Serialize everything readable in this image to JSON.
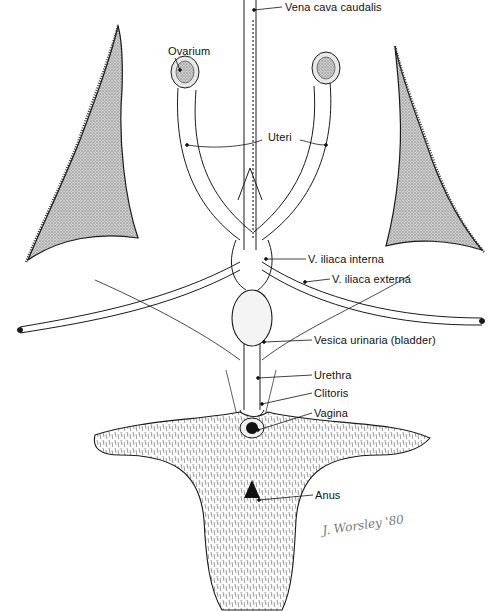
{
  "figure": {
    "type": "anatomical illustration",
    "labels": {
      "vena_cava": "Vena cava caudalis",
      "ovarium": "Ovarium",
      "uteri": "Uteri",
      "iliaca_interna": "V. iliaca interna",
      "iliaca_externa": "V. iliaca externa",
      "vesica": "Vesica urinaria (bladder)",
      "urethra": "Urethra",
      "clitoris": "Clitoris",
      "vagina": "Vagina",
      "anus": "Anus"
    },
    "signature": "J. Worsley '80",
    "colors": {
      "ink": "#1a1a1a",
      "wing_fill": "#b8b8b8",
      "fur": "#444444",
      "background": "#ffffff"
    }
  }
}
